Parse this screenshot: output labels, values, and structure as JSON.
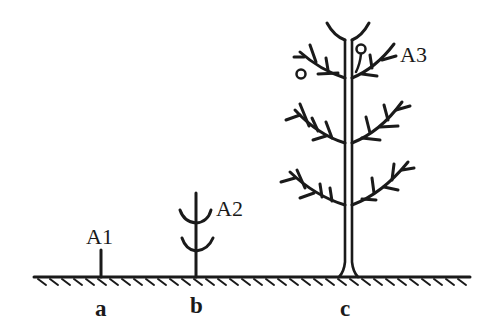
{
  "diagram": {
    "type": "plant growth stages on ground line",
    "colors": {
      "stroke": "#1a1a1a",
      "background": "#ffffff"
    },
    "plants": [
      {
        "id": "A1",
        "label": "A1",
        "position": "a",
        "stage": "short stem, no branches"
      },
      {
        "id": "A2",
        "label": "A2",
        "position": "b",
        "stage": "stem with two pairs of V-shaped branches"
      },
      {
        "id": "A3",
        "label": "A3",
        "position": "c",
        "stage": "tall double-line trunk with three tiers of pinnate branches and two small circles (fruits/buds) near top"
      }
    ],
    "positions": [
      {
        "label": "a"
      },
      {
        "label": "b"
      },
      {
        "label": "c"
      }
    ],
    "ground": {
      "style": "hatched ground line"
    }
  }
}
